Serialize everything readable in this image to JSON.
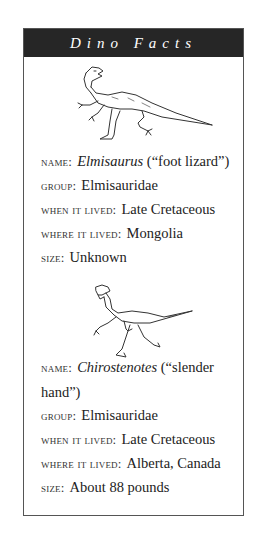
{
  "sidebar": {
    "title": "Dino Facts",
    "entries": [
      {
        "illustration": "elmisaurus-illustration",
        "name_label": "NAME:",
        "name_italic": "Elmisaurus",
        "name_meaning": " (“foot lizard”)",
        "group_label": "GROUP:",
        "group": "Elmisauridae",
        "when_label": "WHEN IT LIVED:",
        "when": "Late Cretaceous",
        "where_label": "WHERE IT LIVED:",
        "where": "Mongolia",
        "size_label": "SIZE:",
        "size": "Unknown"
      },
      {
        "illustration": "chirostenotes-illustration",
        "name_label": "NAME:",
        "name_italic": "Chirostenotes",
        "name_meaning": " (“slender hand”)",
        "group_label": "GROUP:",
        "group": "Elmisauridae",
        "when_label": "WHEN IT LIVED:",
        "when": "Late Cretaceous",
        "where_label": "WHERE IT LIVED:",
        "where": "Alberta, Canada",
        "size_label": "SIZE:",
        "size": "About 88 pounds"
      }
    ]
  },
  "colors": {
    "header_bg": "#262626",
    "header_text": "#ffffff",
    "border": "#555555",
    "text": "#222222"
  }
}
